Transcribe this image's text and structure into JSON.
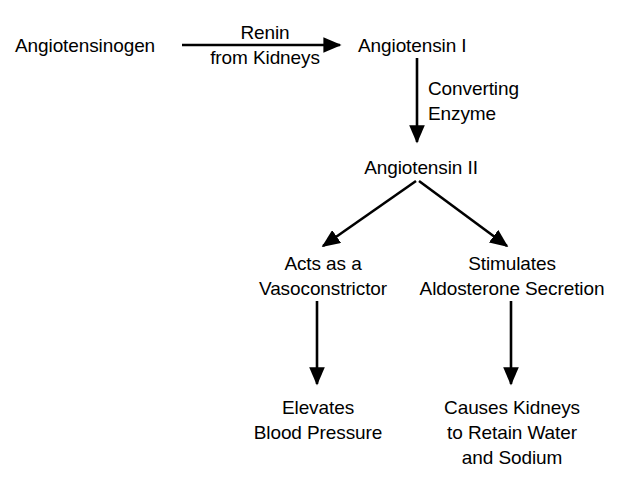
{
  "diagram": {
    "stroke_color": "#000000",
    "background_color": "#ffffff",
    "text_color": "#000000",
    "nodes": {
      "angiotensinogen": "Angiotensinogen",
      "angiotensin_1": "Angiotensin I",
      "angiotensin_2": "Angiotensin II",
      "vasoconstrictor_line1": "Acts as a",
      "vasoconstrictor_line2": "Vasoconstrictor",
      "aldosterone_line1": "Stimulates",
      "aldosterone_line2": "Aldosterone Secretion",
      "blood_pressure_line1": "Elevates",
      "blood_pressure_line2": "Blood Pressure",
      "retain_water_line1": "Causes Kidneys",
      "retain_water_line2": "to Retain Water",
      "retain_water_line3": "and Sodium"
    },
    "edge_labels": {
      "renin_line1": "Renin",
      "renin_line2": "from Kidneys",
      "converting_line1": "Converting",
      "converting_line2": "Enzyme"
    },
    "arrows": [
      {
        "name": "arrow-angiotensinogen-to-angiotensin1",
        "from": "angiotensinogen",
        "to": "angiotensin_1",
        "label": "Renin from Kidneys",
        "direction": "right"
      },
      {
        "name": "arrow-angiotensin1-to-angiotensin2",
        "from": "angiotensin_1",
        "to": "angiotensin_2",
        "label": "Converting Enzyme",
        "direction": "down"
      },
      {
        "name": "arrow-angiotensin2-to-vasoconstrictor",
        "from": "angiotensin_2",
        "to": "vasoconstrictor",
        "label": "",
        "direction": "down-left"
      },
      {
        "name": "arrow-angiotensin2-to-aldosterone",
        "from": "angiotensin_2",
        "to": "aldosterone",
        "label": "",
        "direction": "down-right"
      },
      {
        "name": "arrow-vasoconstrictor-to-blood-pressure",
        "from": "vasoconstrictor",
        "to": "blood_pressure",
        "label": "",
        "direction": "down"
      },
      {
        "name": "arrow-aldosterone-to-retain-water",
        "from": "aldosterone",
        "to": "retain_water",
        "label": "",
        "direction": "down"
      }
    ]
  }
}
